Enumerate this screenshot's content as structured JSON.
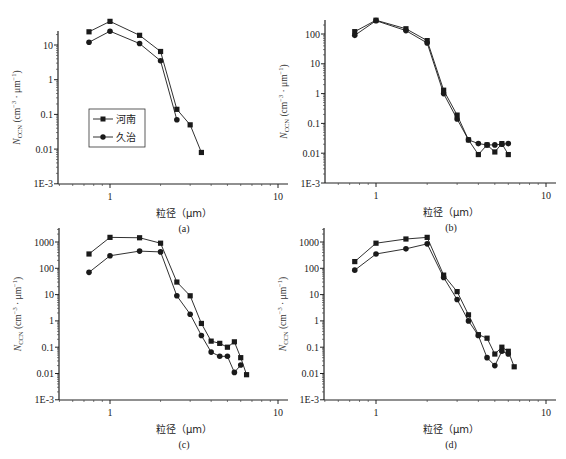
{
  "figure": {
    "legend": [
      {
        "label": "河南",
        "marker": "square"
      },
      {
        "label": "久治",
        "marker": "circle"
      }
    ],
    "xlabel": "粒径（μm）",
    "ylabel": "N_CCN (cm⁻³ · μm⁻¹)",
    "colors": {
      "series": "#1a1a1a",
      "axis": "#222222",
      "background": "#ffffff"
    }
  },
  "chart_data": [
    {
      "panel": "(a)",
      "type": "line",
      "xscale": "log",
      "yscale": "log",
      "xlabel": "粒径（μm）",
      "ylabel": "N_CCN (cm⁻³ · μm⁻¹)",
      "xlim": [
        0.5,
        10
      ],
      "ylim": [
        0.001,
        60
      ],
      "xticks": [
        "1",
        "10"
      ],
      "yticks": [
        "1E-3",
        "0.01",
        "0.1",
        "1",
        "10"
      ],
      "legend_position": "lower-left inside",
      "series": [
        {
          "name": "河南",
          "marker": "square",
          "x": [
            0.75,
            1.0,
            1.5,
            2.0,
            2.5,
            3.0,
            3.5
          ],
          "y": [
            24,
            48,
            19,
            6.5,
            0.14,
            0.05,
            0.008
          ]
        },
        {
          "name": "久治",
          "marker": "circle",
          "x": [
            0.75,
            1.0,
            1.5,
            2.0,
            2.5
          ],
          "y": [
            12,
            25,
            11,
            3.5,
            0.07
          ]
        }
      ]
    },
    {
      "panel": "(b)",
      "type": "line",
      "xscale": "log",
      "yscale": "log",
      "xlabel": "粒径（μm）",
      "ylabel": "N_CCN (cm⁻³ · μm⁻¹)",
      "xlim": [
        0.5,
        10
      ],
      "ylim": [
        0.001,
        400
      ],
      "xticks": [
        "1",
        "10"
      ],
      "yticks": [
        "1E-3",
        "0.01",
        "0.1",
        "1",
        "10",
        "100"
      ],
      "series": [
        {
          "name": "河南",
          "marker": "square",
          "x": [
            0.75,
            1.0,
            1.5,
            2.0,
            2.5,
            3.0,
            3.5,
            4.0,
            4.5,
            5.0,
            5.5,
            6.0
          ],
          "y": [
            120,
            290,
            150,
            60,
            1.3,
            0.19,
            0.028,
            0.009,
            0.019,
            0.011,
            0.021,
            0.009
          ]
        },
        {
          "name": "久治",
          "marker": "circle",
          "x": [
            0.75,
            1.0,
            1.5,
            2.0,
            2.5,
            3.0,
            3.5,
            4.0,
            4.5,
            5.0,
            5.5,
            6.0
          ],
          "y": [
            90,
            280,
            130,
            50,
            1.0,
            0.14,
            0.028,
            0.021,
            0.019,
            0.019,
            0.02,
            0.021
          ]
        }
      ]
    },
    {
      "panel": "(c)",
      "type": "line",
      "xscale": "log",
      "yscale": "log",
      "xlabel": "粒径（μm）",
      "ylabel": "N_CCN (cm⁻³ · μm⁻¹)",
      "xlim": [
        0.5,
        10
      ],
      "ylim": [
        0.001,
        2000
      ],
      "xticks": [
        "1",
        "10"
      ],
      "yticks": [
        "1E-3",
        "0.01",
        "0.1",
        "1",
        "10",
        "100",
        "1000"
      ],
      "series": [
        {
          "name": "河南",
          "marker": "square",
          "x": [
            0.75,
            1.0,
            1.5,
            2.0,
            2.5,
            3.0,
            3.5,
            4.0,
            4.5,
            5.0,
            5.5,
            6.0,
            6.5
          ],
          "y": [
            350,
            1500,
            1450,
            900,
            30,
            9,
            0.8,
            0.17,
            0.14,
            0.1,
            0.16,
            0.04,
            0.009
          ]
        },
        {
          "name": "久治",
          "marker": "circle",
          "x": [
            0.75,
            1.0,
            1.5,
            2.0,
            2.5,
            3.0,
            3.5,
            4.0,
            4.5,
            5.0,
            5.5,
            6.0
          ],
          "y": [
            70,
            300,
            450,
            420,
            9,
            1.8,
            0.28,
            0.065,
            0.045,
            0.045,
            0.011,
            0.021
          ]
        }
      ]
    },
    {
      "panel": "(d)",
      "type": "line",
      "xscale": "log",
      "yscale": "log",
      "xlabel": "粒径（μm）",
      "ylabel": "N_CCN (cm⁻³ · μm⁻¹)",
      "xlim": [
        0.5,
        10
      ],
      "ylim": [
        0.001,
        2000
      ],
      "xticks": [
        "1",
        "10"
      ],
      "yticks": [
        "1E-3",
        "0.01",
        "0.1",
        "1",
        "10",
        "100",
        "1000"
      ],
      "series": [
        {
          "name": "河南",
          "marker": "square",
          "x": [
            0.75,
            1.0,
            1.5,
            2.0,
            2.5,
            3.0,
            3.5,
            4.0,
            4.5,
            5.0,
            5.5,
            6.0,
            6.5
          ],
          "y": [
            180,
            900,
            1300,
            1500,
            55,
            13,
            1.7,
            0.3,
            0.22,
            0.055,
            0.1,
            0.07,
            0.018
          ]
        },
        {
          "name": "久治",
          "marker": "circle",
          "x": [
            0.75,
            1.0,
            1.5,
            2.0,
            2.5,
            3.0,
            3.5,
            4.0,
            4.5,
            5.0,
            5.5,
            6.0
          ],
          "y": [
            85,
            350,
            550,
            850,
            45,
            6.5,
            1.0,
            0.28,
            0.04,
            0.02,
            0.07,
            0.055
          ]
        }
      ]
    }
  ],
  "panels_layout": [
    {
      "x0": 58,
      "y_axis_x": 58,
      "x_axis_y": 184,
      "x1px": 110,
      "x10px": 278,
      "ytop_decade": 1,
      "ytop_px": 45,
      "decade_px": 34.7
    },
    {
      "y_axis_x": 325,
      "x_axis_y": 183,
      "x1px": 376,
      "x10px": 546,
      "ytop_decade": 2,
      "ytop_px": 34,
      "decade_px": 29.8
    },
    {
      "y_axis_x": 59,
      "x_axis_y": 400,
      "x1px": 110,
      "x10px": 278,
      "ytop_decade": 3,
      "ytop_px": 242,
      "decade_px": 26.3
    },
    {
      "y_axis_x": 324,
      "x_axis_y": 400,
      "x1px": 376,
      "x10px": 546,
      "ytop_decade": 3,
      "ytop_px": 242,
      "decade_px": 26.3
    }
  ]
}
